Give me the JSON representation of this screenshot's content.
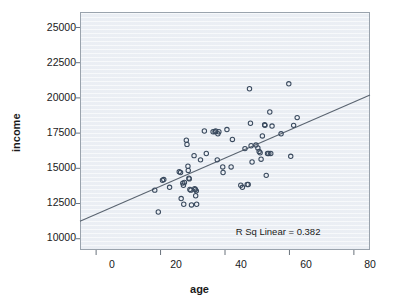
{
  "chart_data": {
    "type": "scatter",
    "title": "",
    "xlabel": "age",
    "ylabel": "income",
    "xlim": [
      -5,
      85
    ],
    "ylim": [
      9200,
      26100
    ],
    "xticks": [
      0,
      20,
      40,
      60,
      80
    ],
    "yticks": [
      10000,
      12500,
      15000,
      17500,
      20000,
      22500,
      25000
    ],
    "grid": false,
    "legend": false,
    "annotations": [
      {
        "name": "r-squared-annotation",
        "text": "R Sq Linear = 0.382",
        "x": 70,
        "y": 10500
      }
    ],
    "fit_line": {
      "name": "linear-fit-line",
      "label": "Linear fit",
      "r_squared": 0.382,
      "x_start": -5,
      "y_start": 11250,
      "x_end": 85,
      "y_end": 20200,
      "color": "#5a6470"
    },
    "marker": {
      "shape": "open-circle",
      "edge_color": "#3a4a5e",
      "fill_color": "none",
      "size": 4.4
    },
    "points": [
      [
        18.2,
        13450
      ],
      [
        19.3,
        11900
      ],
      [
        20.6,
        14150
      ],
      [
        21.0,
        14200
      ],
      [
        22.8,
        13650
      ],
      [
        25.8,
        14750
      ],
      [
        26.2,
        14700
      ],
      [
        26.4,
        12850
      ],
      [
        26.9,
        13950
      ],
      [
        27.1,
        13800
      ],
      [
        27.2,
        12450
      ],
      [
        27.4,
        14000
      ],
      [
        28.0,
        17000
      ],
      [
        28.2,
        16700
      ],
      [
        28.5,
        15150
      ],
      [
        28.6,
        14850
      ],
      [
        28.8,
        14300
      ],
      [
        28.9,
        14250
      ],
      [
        29.1,
        13500
      ],
      [
        29.4,
        13450
      ],
      [
        29.6,
        12400
      ],
      [
        30.4,
        15900
      ],
      [
        30.6,
        13550
      ],
      [
        30.8,
        13500
      ],
      [
        30.9,
        13050
      ],
      [
        31.1,
        13400
      ],
      [
        31.2,
        12450
      ],
      [
        32.4,
        15600
      ],
      [
        33.6,
        17650
      ],
      [
        34.2,
        16050
      ],
      [
        36.3,
        17600
      ],
      [
        36.9,
        17600
      ],
      [
        37.1,
        17650
      ],
      [
        37.6,
        15600
      ],
      [
        37.8,
        17450
      ],
      [
        38.1,
        17600
      ],
      [
        39.3,
        15100
      ],
      [
        39.4,
        14700
      ],
      [
        40.6,
        17750
      ],
      [
        41.9,
        15100
      ],
      [
        42.3,
        17050
      ],
      [
        44.9,
        13800
      ],
      [
        45.4,
        13650
      ],
      [
        46.2,
        16400
      ],
      [
        46.9,
        13850
      ],
      [
        47.2,
        13850
      ],
      [
        47.6,
        20650
      ],
      [
        47.9,
        18200
      ],
      [
        48.1,
        16600
      ],
      [
        48.4,
        15450
      ],
      [
        49.6,
        16650
      ],
      [
        50.2,
        16450
      ],
      [
        50.6,
        16200
      ],
      [
        50.9,
        16100
      ],
      [
        51.2,
        15650
      ],
      [
        51.6,
        17300
      ],
      [
        52.3,
        18100
      ],
      [
        52.4,
        18050
      ],
      [
        52.8,
        14500
      ],
      [
        53.2,
        16050
      ],
      [
        53.6,
        16050
      ],
      [
        53.9,
        19000
      ],
      [
        54.2,
        16050
      ],
      [
        54.6,
        18000
      ],
      [
        57.4,
        17450
      ],
      [
        59.8,
        21000
      ],
      [
        60.4,
        15850
      ],
      [
        61.3,
        18050
      ],
      [
        62.4,
        18600
      ]
    ]
  },
  "axes": {
    "y_tick_labels": [
      "25000",
      "22500",
      "20000",
      "17500",
      "15000",
      "12500",
      "10000"
    ],
    "x_tick_labels": [
      "0",
      "20",
      "40",
      "60",
      "80"
    ]
  }
}
